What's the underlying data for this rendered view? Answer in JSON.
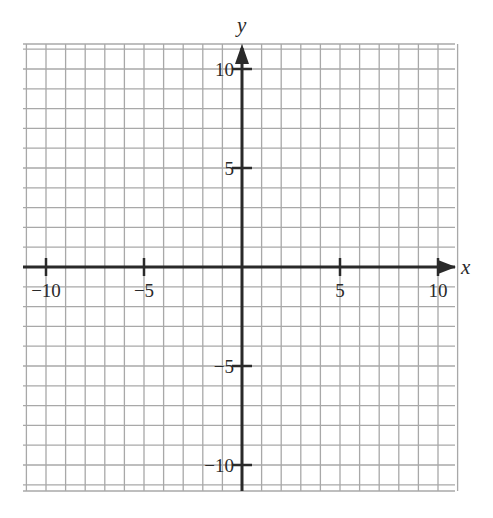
{
  "chart_data": {
    "type": "scatter",
    "title": "",
    "xlabel": "x",
    "ylabel": "y",
    "xlim": [
      -11,
      11
    ],
    "ylim": [
      -11,
      11.3
    ],
    "grid": true,
    "grid_step": 1,
    "x_ticks": [
      -10,
      -5,
      5,
      10
    ],
    "y_ticks": [
      -10,
      -5,
      5,
      10
    ],
    "x_tick_labels": [
      "−10",
      "−5",
      "5",
      "10"
    ],
    "y_tick_labels": [
      "−10",
      "−5",
      "5",
      "10"
    ],
    "series": [],
    "legend": null
  },
  "style": {
    "grid_color": "#a8a8a8",
    "axis_color": "#2a2a2a",
    "background": "#ffffff"
  },
  "layout": {
    "origin_px": [
      242,
      267
    ],
    "unit_px_x": 19.6,
    "unit_px_y": 19.8,
    "grid_px": {
      "left": 23,
      "right": 455,
      "top": 44,
      "bottom": 491
    }
  }
}
